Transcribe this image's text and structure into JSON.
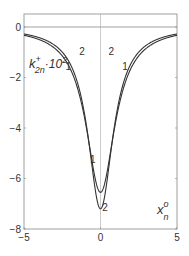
{
  "chart_data": {
    "type": "line",
    "title": "",
    "xlabel": "x_n^o",
    "ylabel": "k_2n^+ · 10^2",
    "xlim": [
      -5,
      5
    ],
    "ylim": [
      -8,
      0
    ],
    "xticks": [
      "-5",
      "0",
      "5"
    ],
    "yticks": [
      "0",
      "-2",
      "-4",
      "-6",
      "-8"
    ],
    "grid": false,
    "legend": "inline curve labels 1 and 2",
    "series": [
      {
        "name": "1",
        "x": [
          -5,
          -4,
          -3,
          -2,
          -1.5,
          -1,
          -0.5,
          0,
          0.5,
          1,
          1.5,
          2,
          3,
          4,
          5
        ],
        "y": [
          -0.05,
          -0.15,
          -0.4,
          -1.1,
          -2.0,
          -3.6,
          -5.6,
          -6.55,
          -5.6,
          -3.6,
          -2.0,
          -1.1,
          -0.4,
          -0.15,
          -0.05
        ]
      },
      {
        "name": "2",
        "x": [
          -5,
          -4,
          -3,
          -2,
          -1.5,
          -1,
          -0.5,
          0,
          0.5,
          1,
          1.5,
          2,
          3,
          4,
          5
        ],
        "y": [
          -0.03,
          -0.1,
          -0.3,
          -0.9,
          -1.8,
          -3.6,
          -6.0,
          -7.2,
          -6.0,
          -3.6,
          -1.8,
          -0.9,
          -0.3,
          -0.1,
          -0.03
        ]
      }
    ],
    "annotations": [
      {
        "text": "1",
        "x": -2.1,
        "y": -1.7
      },
      {
        "text": "2",
        "x": -1.2,
        "y": -1.1
      },
      {
        "text": "2",
        "x": 0.7,
        "y": -1.1
      },
      {
        "text": "1",
        "x": 1.6,
        "y": -1.7
      },
      {
        "text": "1",
        "x": -0.5,
        "y": -5.4
      },
      {
        "text": "2",
        "x": 0.3,
        "y": -7.3
      }
    ]
  },
  "labels": {
    "y_main": "k",
    "y_sup": "+",
    "y_sub": "2n",
    "y_mult": "·10",
    "y_exp": "2",
    "x_main": "x",
    "x_sup": "o",
    "x_sub": "n"
  }
}
